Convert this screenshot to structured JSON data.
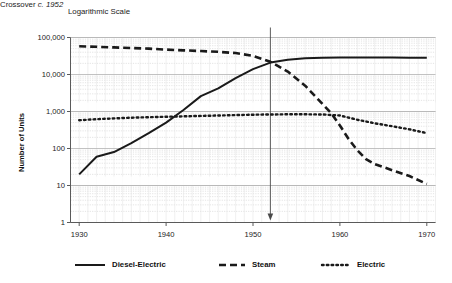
{
  "chart_data": {
    "type": "line",
    "title": "Logarithmic Scale",
    "xlabel": "",
    "ylabel": "Number of Units",
    "scale": "log",
    "grid": true,
    "legend_position": "bottom",
    "xlim": [
      1929,
      1971
    ],
    "ylim": [
      1,
      100000
    ],
    "x_ticks": [
      "1930",
      "1940",
      "1950",
      "1960",
      "1970"
    ],
    "x_tick_values": [
      1930,
      1940,
      1950,
      1960,
      1970
    ],
    "y_ticks": [
      "100,000",
      "10,000",
      "1,000",
      "100",
      "10",
      "1"
    ],
    "y_tick_values": [
      100000,
      10000,
      1000,
      100,
      10,
      1
    ],
    "annotations": [
      {
        "name": "crossover-annotation",
        "text_plain": "Crossover c. 1952",
        "text_prefix": "Crossover ",
        "text_italic": "c. 1952",
        "x": 1952,
        "y_top": 100000,
        "y_bottom": 1
      }
    ],
    "series": [
      {
        "name": "Diesel-Electric",
        "style": "solid",
        "color": "#1a1a1a",
        "x": [
          1930,
          1932,
          1934,
          1936,
          1938,
          1940,
          1942,
          1944,
          1946,
          1948,
          1950,
          1952,
          1954,
          1956,
          1958,
          1960,
          1962,
          1964,
          1966,
          1968,
          1970
        ],
        "values": [
          20,
          60,
          80,
          140,
          260,
          500,
          1100,
          2600,
          4200,
          8000,
          14000,
          21000,
          25000,
          27500,
          28500,
          29000,
          29000,
          29000,
          28800,
          28500,
          28300
        ]
      },
      {
        "name": "Steam",
        "style": "dashed",
        "color": "#1a1a1a",
        "x": [
          1930,
          1932,
          1934,
          1936,
          1938,
          1940,
          1942,
          1944,
          1946,
          1948,
          1950,
          1952,
          1954,
          1956,
          1958,
          1959,
          1960,
          1961,
          1962,
          1963,
          1964,
          1966,
          1968,
          1970
        ],
        "values": [
          58000,
          56000,
          54000,
          52000,
          50000,
          47000,
          45000,
          43000,
          41000,
          38000,
          32000,
          22000,
          12000,
          5000,
          1600,
          900,
          420,
          180,
          90,
          52,
          38,
          26,
          18,
          11
        ]
      },
      {
        "name": "Electric",
        "style": "dotted",
        "color": "#1a1a1a",
        "x": [
          1930,
          1932,
          1934,
          1936,
          1938,
          1940,
          1942,
          1944,
          1946,
          1948,
          1950,
          1952,
          1954,
          1956,
          1958,
          1960,
          1962,
          1964,
          1966,
          1968,
          1970
        ],
        "values": [
          580,
          620,
          650,
          680,
          700,
          720,
          740,
          760,
          780,
          800,
          820,
          830,
          840,
          840,
          830,
          780,
          600,
          480,
          400,
          330,
          260
        ]
      }
    ]
  },
  "legend": {
    "items": [
      {
        "label": "Diesel-Electric",
        "style": "solid"
      },
      {
        "label": "Steam",
        "style": "dashed"
      },
      {
        "label": "Electric",
        "style": "dotted"
      }
    ]
  }
}
